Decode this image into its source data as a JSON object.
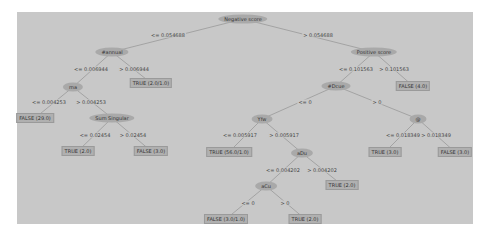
{
  "tree": {
    "nodes": [
      {
        "id": "n0",
        "type": "split",
        "label": "Negative score",
        "x": 243,
        "y": 19
      },
      {
        "id": "n1",
        "type": "split",
        "label": "#annual",
        "x": 112,
        "y": 52
      },
      {
        "id": "n2",
        "type": "split",
        "label": "rna",
        "x": 73,
        "y": 87
      },
      {
        "id": "n3",
        "type": "leaf",
        "label": "FALSE (29.0)",
        "x": 35,
        "y": 118
      },
      {
        "id": "n4",
        "type": "split",
        "label": "Sum Singular",
        "x": 112,
        "y": 118
      },
      {
        "id": "n5",
        "type": "leaf",
        "label": "TRUE (2.0)",
        "x": 78,
        "y": 151
      },
      {
        "id": "n6",
        "type": "leaf",
        "label": "FALSE (3.0)",
        "x": 151,
        "y": 151
      },
      {
        "id": "n7",
        "type": "leaf",
        "label": "TRUE (2.0/1.0)",
        "x": 151,
        "y": 83
      },
      {
        "id": "n8",
        "type": "split",
        "label": "Positive score",
        "x": 374,
        "y": 52
      },
      {
        "id": "n9",
        "type": "split",
        "label": "#Dcue",
        "x": 336,
        "y": 86
      },
      {
        "id": "n10",
        "type": "leaf",
        "label": "FALSE (4.0)",
        "x": 413,
        "y": 86
      },
      {
        "id": "n11",
        "type": "split",
        "label": "Yfw",
        "x": 262,
        "y": 119
      },
      {
        "id": "n12",
        "type": "split",
        "label": "@",
        "x": 418,
        "y": 119
      },
      {
        "id": "n13",
        "type": "leaf",
        "label": "TRUE (56.0/1.0)",
        "x": 229,
        "y": 152
      },
      {
        "id": "n14",
        "type": "split",
        "label": "aDu",
        "x": 302,
        "y": 153
      },
      {
        "id": "n15",
        "type": "split",
        "label": "aCu",
        "x": 266,
        "y": 186
      },
      {
        "id": "n16",
        "type": "leaf",
        "label": "TRUE (2.0)",
        "x": 342,
        "y": 185
      },
      {
        "id": "n17",
        "type": "leaf",
        "label": "FALSE (3.0/1.0)",
        "x": 226,
        "y": 219
      },
      {
        "id": "n18",
        "type": "leaf",
        "label": "TRUE (2.0)",
        "x": 305,
        "y": 219
      },
      {
        "id": "n19",
        "type": "leaf",
        "label": "TRUE (3.0)",
        "x": 385,
        "y": 152
      },
      {
        "id": "n20",
        "type": "leaf",
        "label": "FALSE (3.0)",
        "x": 455,
        "y": 152
      }
    ],
    "edges": [
      {
        "from": "n0",
        "to": "n1",
        "label": "<= 0.054688",
        "lx": 168,
        "ly": 35
      },
      {
        "from": "n0",
        "to": "n8",
        "label": "> 0.054688",
        "lx": 318,
        "ly": 35
      },
      {
        "from": "n1",
        "to": "n2",
        "label": "<= 0.006944",
        "lx": 91,
        "ly": 69
      },
      {
        "from": "n1",
        "to": "n7",
        "label": "> 0.006944",
        "lx": 134,
        "ly": 69
      },
      {
        "from": "n2",
        "to": "n3",
        "label": "<= 0.004253",
        "lx": 49,
        "ly": 102
      },
      {
        "from": "n2",
        "to": "n4",
        "label": "> 0.004253",
        "lx": 91,
        "ly": 102
      },
      {
        "from": "n4",
        "to": "n5",
        "label": "<= 0.02454",
        "lx": 95,
        "ly": 135
      },
      {
        "from": "n4",
        "to": "n6",
        "label": "> 0.02454",
        "lx": 133,
        "ly": 135
      },
      {
        "from": "n8",
        "to": "n9",
        "label": "<= 0.101563",
        "lx": 356,
        "ly": 69
      },
      {
        "from": "n8",
        "to": "n10",
        "label": "> 0.101563",
        "lx": 394,
        "ly": 69
      },
      {
        "from": "n9",
        "to": "n11",
        "label": "<= 0",
        "lx": 305,
        "ly": 102
      },
      {
        "from": "n9",
        "to": "n12",
        "label": "> 0",
        "lx": 377,
        "ly": 102
      },
      {
        "from": "n11",
        "to": "n13",
        "label": "<= 0.005917",
        "lx": 240,
        "ly": 135
      },
      {
        "from": "n11",
        "to": "n14",
        "label": "> 0.005917",
        "lx": 284,
        "ly": 135
      },
      {
        "from": "n14",
        "to": "n15",
        "label": "<= 0.004202",
        "lx": 283,
        "ly": 170
      },
      {
        "from": "n14",
        "to": "n16",
        "label": "> 0.004202",
        "lx": 322,
        "ly": 170
      },
      {
        "from": "n15",
        "to": "n17",
        "label": "<= 0",
        "lx": 248,
        "ly": 203
      },
      {
        "from": "n15",
        "to": "n18",
        "label": "> 0",
        "lx": 285,
        "ly": 203
      },
      {
        "from": "n12",
        "to": "n19",
        "label": "<= 0.018349",
        "lx": 403,
        "ly": 135
      },
      {
        "from": "n12",
        "to": "n20",
        "label": "> 0.018349",
        "lx": 436,
        "ly": 135
      }
    ]
  },
  "colors": {
    "panel_bg": "#c8c8c8",
    "split_node_fill": "#a9a9a9",
    "leaf_node_fill": "#b0b0b0",
    "edge_stroke": "#8a8a8a",
    "text": "#333333"
  }
}
